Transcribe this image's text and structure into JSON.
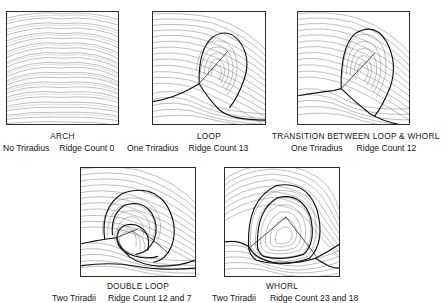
{
  "figure": {
    "background_color": "#ffffff",
    "ink_color": "#111111",
    "ridge_color": "#555555"
  },
  "patterns": [
    {
      "id": "arch",
      "name": "ARCH",
      "triradius_label": "No Triradius",
      "ridge_count_label": "Ridge Count 0",
      "triradii_count": 0,
      "ridge_counts": [
        0
      ]
    },
    {
      "id": "loop",
      "name": "LOOP",
      "triradius_label": "One Triradius",
      "ridge_count_label": "Ridge Count 13",
      "triradii_count": 1,
      "ridge_counts": [
        13
      ]
    },
    {
      "id": "transition",
      "name": "TRANSITION BETWEEN LOOP & WHORL",
      "triradius_label": "One Triradius",
      "ridge_count_label": "Ridge Count 12",
      "triradii_count": 1,
      "ridge_counts": [
        12
      ]
    },
    {
      "id": "double-loop",
      "name": "DOUBLE LOOP",
      "triradius_label": "Two Triradii",
      "ridge_count_label": "Ridge Count 12 and 7",
      "triradii_count": 2,
      "ridge_counts": [
        12,
        7
      ]
    },
    {
      "id": "whorl",
      "name": "WHORL",
      "triradius_label": "Two Triradii",
      "ridge_count_label": "Ridge Count 23 and 18",
      "triradii_count": 2,
      "ridge_counts": [
        23,
        18
      ]
    }
  ]
}
